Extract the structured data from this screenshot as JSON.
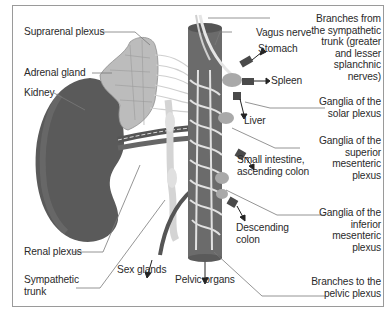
{
  "figure": {
    "colors": {
      "kidney": "#5a5a5a",
      "adrenal": "#bdbdbd",
      "aorta": "#6b6b6b",
      "nerve": "#e2e2e2",
      "ganglion": "#a9a9a9",
      "leader": "#7a7a7a",
      "text": "#2a2a2a"
    }
  },
  "labels": {
    "suprarenal_plexus": "Suprarenal plexus",
    "adrenal_gland": "Adrenal gland",
    "kidney": "Kidney",
    "renal_plexus": "Renal plexus",
    "sympathetic_trunk": "Sympathetic\ntrunk",
    "sex_glands": "Sex glands",
    "pelvic_organs": "Pelvic organs",
    "vagus_nerve": "Vagus nerve",
    "stomach": "Stomach",
    "spleen": "Spleen",
    "liver": "Liver",
    "small_intestine": "Small intestine,\nascending colon",
    "descending_colon": "Descending\ncolon",
    "branches_sympathetic": "Branches from\nthe sympathetic\ntrunk (greater\nand lesser\nsplanchnic\nnerves)",
    "ganglia_solar": "Ganglia of the\nsolar plexus",
    "ganglia_superior": "Ganglia of the\nsuperior\nmesenteric\nplexus",
    "ganglia_inferior": "Ganglia of the\ninferior\nmesenteric\nplexus",
    "branches_pelvic": "Branches to the\npelvic plexus"
  }
}
